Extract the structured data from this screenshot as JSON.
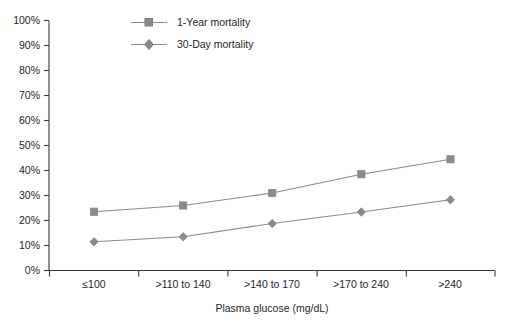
{
  "chart_data": {
    "type": "line",
    "title": "",
    "xlabel": "Plasma glucose (mg/dL)",
    "ylabel": "",
    "categories": [
      "≤100",
      ">110 to 140",
      ">140 to 170",
      ">170 to 240",
      ">240"
    ],
    "series": [
      {
        "name": "1-Year mortality",
        "marker": "square",
        "color": "#8a8a8a",
        "values": [
          23.5,
          26.0,
          31.0,
          38.5,
          44.5
        ]
      },
      {
        "name": "30-Day mortality",
        "marker": "diamond",
        "color": "#8a8a8a",
        "values": [
          11.5,
          13.5,
          18.8,
          23.4,
          28.3
        ]
      }
    ],
    "ylim": [
      0,
      100
    ],
    "ytick_labels": [
      "0%",
      "10%",
      "20%",
      "30%",
      "40%",
      "50%",
      "60%",
      "70%",
      "80%",
      "90%",
      "100%"
    ],
    "ytick_values": [
      0,
      10,
      20,
      30,
      40,
      50,
      60,
      70,
      80,
      90,
      100
    ],
    "grid": false,
    "legend_position": "top-center",
    "axis_color": "#3a3a3a",
    "background_color": "#ffffff"
  },
  "legend": {
    "items": [
      {
        "label": "1-Year mortality",
        "marker": "square-marker-icon"
      },
      {
        "label": "30-Day mortality",
        "marker": "diamond-marker-icon"
      }
    ]
  },
  "axis": {
    "x_title": "Plasma glucose (mg/dL)"
  }
}
